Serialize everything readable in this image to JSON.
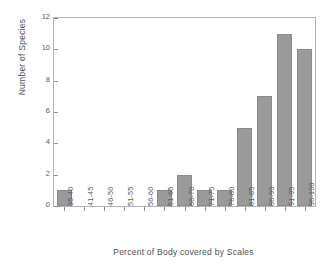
{
  "chart_data": {
    "type": "bar",
    "title": "",
    "subtitle": "",
    "xlabel": "Percent of Body covered by Scales",
    "ylabel": "Number of Species",
    "categories": [
      "35-40",
      "41-45",
      "46-50",
      "51-55",
      "56-60",
      "61-65",
      "66-70",
      "71-75",
      "76-80",
      "81-85",
      "86-90",
      "91-95",
      "96-100"
    ],
    "values": [
      1,
      0,
      0,
      0,
      0,
      1,
      2,
      1,
      1,
      5,
      7,
      11,
      10
    ],
    "ylim": [
      0,
      12
    ],
    "yticks": [
      0,
      2,
      4,
      6,
      8,
      10,
      12
    ],
    "ytick_labels": [
      "0",
      "2",
      "4",
      "6",
      "8",
      "10",
      "12"
    ],
    "grid": false,
    "legend": false,
    "legend_position": "none",
    "bar_color": "#9a9a9a",
    "bar_edge_color": "#8a8a8a",
    "frame_color": "#b4b4b4",
    "text_color": "#565656",
    "background": "#ffffff"
  }
}
